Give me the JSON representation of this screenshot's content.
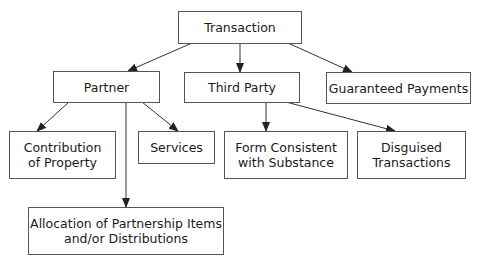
{
  "diagram": {
    "type": "tree",
    "nodes": {
      "transaction": "Transaction",
      "partner": "Partner",
      "third_party": "Third Party",
      "guaranteed_payments": "Guaranteed Payments",
      "contribution_of_property": "Contribution\nof Property",
      "services": "Services",
      "allocation": "Allocation of Partnership Items\nand/or Distributions",
      "form_consistent": "Form Consistent\nwith Substance",
      "disguised_transactions": "Disguised\nTransactions"
    },
    "edges": [
      {
        "from": "Transaction",
        "to": "Partner"
      },
      {
        "from": "Transaction",
        "to": "Third Party"
      },
      {
        "from": "Transaction",
        "to": "Guaranteed Payments"
      },
      {
        "from": "Partner",
        "to": "Contribution of Property"
      },
      {
        "from": "Partner",
        "to": "Services"
      },
      {
        "from": "Partner",
        "to": "Allocation of Partnership Items and/or Distributions"
      },
      {
        "from": "Third Party",
        "to": "Form Consistent with Substance"
      },
      {
        "from": "Third Party",
        "to": "Disguised Transactions"
      }
    ]
  }
}
